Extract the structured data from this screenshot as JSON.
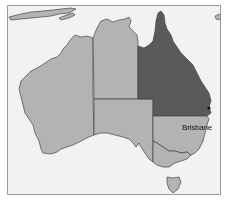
{
  "map": {
    "title": "",
    "colors": {
      "ocean": "#f2f2f2",
      "land": "#b3b3b3",
      "highlight": "#5a5a5a",
      "border": "#444444",
      "frame": "#9a9a9a"
    },
    "regions": [
      {
        "name": "Western Australia",
        "highlighted": false
      },
      {
        "name": "Northern Territory",
        "highlighted": false
      },
      {
        "name": "South Australia",
        "highlighted": false
      },
      {
        "name": "Queensland",
        "highlighted": true
      },
      {
        "name": "New South Wales",
        "highlighted": false
      },
      {
        "name": "Victoria",
        "highlighted": false
      },
      {
        "name": "Tasmania",
        "highlighted": false
      }
    ],
    "cities": [
      {
        "name": "Brisbane",
        "marker": "dot"
      }
    ]
  }
}
